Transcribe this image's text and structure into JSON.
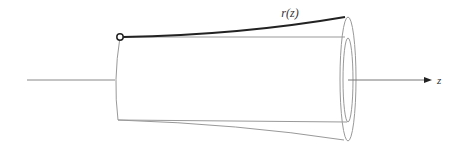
{
  "diagram": {
    "type": "tapered-tube",
    "radius_label": "r(z)",
    "axis_label": "z",
    "colors": {
      "outline": "#9a9a9a",
      "radius_curve": "#222222",
      "axis": "#777777",
      "background": "#ffffff"
    }
  }
}
